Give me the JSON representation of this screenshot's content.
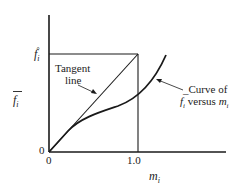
{
  "diagram": {
    "colors": {
      "ink": "#1a1a1a",
      "background": "#ffffff"
    },
    "y_axis": {
      "label": "f",
      "label_subscript": "i",
      "label_has_overbar": true,
      "origin_label": "0",
      "tick_label": "f",
      "tick_label_subscript": "i",
      "tick_label_superscript": "°"
    },
    "x_axis": {
      "label": "m",
      "label_subscript": "i",
      "origin_label": "0",
      "tick_label": "1.0"
    },
    "annotations": {
      "tangent_line": {
        "line1": "Tangent",
        "line2": "line"
      },
      "curve": {
        "line1": "_Curve of",
        "line2_f": "f",
        "line2_f_sub": "i",
        "line2_mid": " versus ",
        "line2_m": "m",
        "line2_m_sub": "i"
      }
    },
    "elements": [
      "y-axis",
      "x-axis",
      "horizontal reference line at f_i°",
      "vertical reference line at m_i = 1.0",
      "tangent line from origin to (1.0, f_i°)",
      "curve of f_i versus m_i"
    ]
  }
}
